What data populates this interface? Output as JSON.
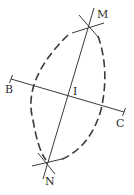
{
  "figure": {
    "type": "geometric construction: perpendicular bisector of segment BC",
    "points": {
      "M": {
        "label": "M",
        "x": 89,
        "y": 26
      },
      "N": {
        "label": "N",
        "x": 47,
        "y": 163
      },
      "B": {
        "label": "B",
        "x": 11,
        "y": 79
      },
      "C": {
        "label": "C",
        "x": 124,
        "y": 112
      },
      "I": {
        "label": "I",
        "x": 68,
        "y": 96
      }
    },
    "labels": {
      "M": "M",
      "N": "N",
      "B": "B",
      "C": "C",
      "I": "I"
    },
    "colors": {
      "stroke": "#3a3a3a",
      "background": "#ffffff"
    }
  }
}
